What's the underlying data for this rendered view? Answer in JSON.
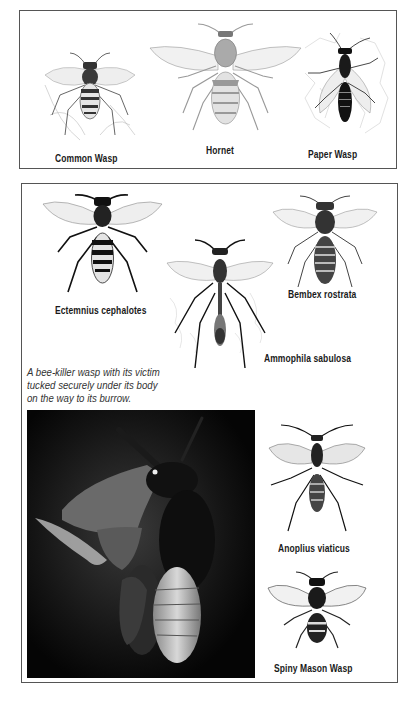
{
  "panel_top": {
    "species": [
      {
        "name": "Common Wasp"
      },
      {
        "name": "Hornet"
      },
      {
        "name": "Paper Wasp"
      }
    ]
  },
  "panel_bottom": {
    "species": [
      {
        "name": "Ectemnius cephalotes"
      },
      {
        "name": "Bembex rostrata"
      },
      {
        "name": "Ammophila sabulosa"
      },
      {
        "name": "Anoplius viaticus"
      },
      {
        "name": "Spiny Mason Wasp"
      }
    ],
    "caption": {
      "lines": [
        "A bee-killer wasp with its victim",
        "tucked securely under its body",
        "on the way to its burrow."
      ]
    },
    "photo": {
      "subject": "bee-killer wasp carrying bee"
    }
  }
}
